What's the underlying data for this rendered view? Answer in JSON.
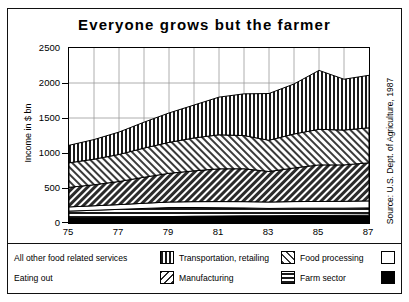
{
  "chart_data": {
    "type": "area",
    "title": "Everyone grows but the farmer",
    "xlabel": "",
    "ylabel": "Income in $ bn",
    "source": "Source: U.S. Dept. of Agriculture, 1987",
    "grid": true,
    "legend_position": "bottom",
    "stacked": true,
    "xlim": [
      75,
      87
    ],
    "ylim": [
      0,
      2500
    ],
    "yticks": [
      0,
      500,
      1000,
      1500,
      2000,
      2500
    ],
    "xticks": [
      75,
      76,
      77,
      78,
      79,
      80,
      81,
      82,
      83,
      84,
      85,
      86,
      87
    ],
    "xtick_labels": [
      "75",
      "77",
      "79",
      "81",
      "83",
      "85",
      "87"
    ],
    "x": [
      75,
      76,
      77,
      78,
      79,
      80,
      81,
      82,
      83,
      84,
      85,
      86,
      87
    ],
    "series": [
      {
        "name": "Eating out",
        "pattern": "solid-black",
        "values": [
          70,
          74,
          80,
          86,
          92,
          97,
          100,
          103,
          104,
          106,
          108,
          110,
          112
        ]
      },
      {
        "name": "Farm sector",
        "pattern": "horizontal-lines",
        "values": [
          100,
          108,
          115,
          122,
          128,
          124,
          118,
          112,
          104,
          106,
          104,
          102,
          104
        ]
      },
      {
        "name": "All other food related services",
        "pattern": "white",
        "values": [
          60,
          64,
          68,
          74,
          80,
          84,
          88,
          90,
          92,
          94,
          96,
          98,
          100
        ]
      },
      {
        "name": "Manufacturing",
        "pattern": "diagonal-dark",
        "values": [
          280,
          300,
          330,
          372,
          410,
          440,
          468,
          470,
          436,
          480,
          522,
          520,
          544
        ]
      },
      {
        "name": "Food processing",
        "pattern": "diagonal-light",
        "values": [
          350,
          366,
          386,
          416,
          442,
          470,
          486,
          474,
          446,
          486,
          508,
          498,
          500
        ]
      },
      {
        "name": "Transportation, retailing",
        "pattern": "vertical-lines",
        "values": [
          250,
          280,
          320,
          370,
          420,
          470,
          538,
          596,
          668,
          714,
          842,
          726,
          750
        ]
      }
    ],
    "totals": [
      1110,
      1192,
      1299,
      1440,
      1572,
      1685,
      1798,
      1845,
      1850,
      1986,
      2180,
      2054,
      2110
    ]
  },
  "legend": {
    "left_labels": [
      "All other food related services",
      "Eating out"
    ],
    "items": [
      {
        "label": "Transportation, retailing",
        "pattern": "vertical-lines"
      },
      {
        "label": "Manufacturing",
        "pattern": "diagonal-dark"
      },
      {
        "label": "Food processing",
        "pattern": "diagonal-light"
      },
      {
        "label": "Farm sector",
        "pattern": "horizontal-lines"
      }
    ],
    "right_swatches": [
      {
        "label": "All other food related services",
        "pattern": "white"
      },
      {
        "label": "Eating out",
        "pattern": "solid-black"
      }
    ]
  }
}
